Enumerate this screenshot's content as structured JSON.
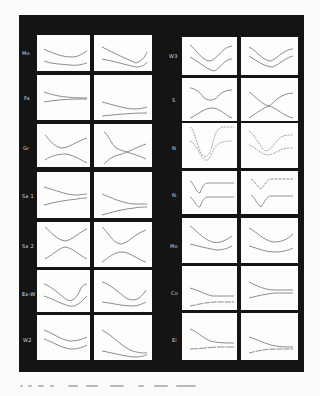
{
  "figure": {
    "left_column": {
      "rows": [
        {
          "label": "Mo"
        },
        {
          "label": "Fa"
        },
        {
          "label": "Gr"
        },
        {
          "label": "Sa 1"
        },
        {
          "label": "Sa 2"
        },
        {
          "label": "Ex-W"
        },
        {
          "label": "W2"
        }
      ]
    },
    "right_column": {
      "rows": [
        {
          "label": "W3"
        },
        {
          "label": "S"
        },
        {
          "label": "N"
        },
        {
          "label": "N."
        },
        {
          "label": "Mo"
        },
        {
          "label": "Co"
        },
        {
          "label": "Ei"
        }
      ]
    },
    "colors": {
      "board": "#141414",
      "panel": "#fdfdfb",
      "curve": "#707070",
      "label": "#d8d8d8",
      "page": "#fbfbf9"
    }
  }
}
